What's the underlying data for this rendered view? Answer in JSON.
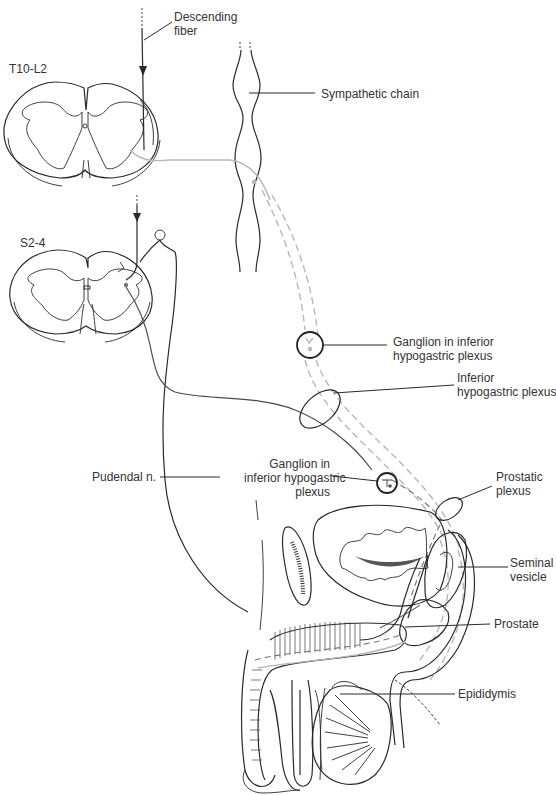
{
  "diagram": {
    "spinal_levels": [
      {
        "id": "thoracolumbar",
        "label": "T10-L2"
      },
      {
        "id": "sacral",
        "label": "S2-4"
      }
    ],
    "labels": {
      "descending_fiber": [
        "Descending",
        "fiber"
      ],
      "sympathetic_chain": "Sympathetic chain",
      "ganglion_upper": [
        "Ganglion in inferior",
        "hypogastric plexus"
      ],
      "inferior_hypogastric_plexus": [
        "Inferior",
        "hypogastric plexus"
      ],
      "pudendal_nerve": "Pudendal n.",
      "ganglion_lower": [
        "Ganglion in",
        "inferior hypogastric",
        "plexus"
      ],
      "prostatic_plexus": [
        "Prostatic",
        "plexus"
      ],
      "seminal_vesicle": [
        "Seminal",
        "vesicle"
      ],
      "prostate": "Prostate",
      "epididymis": "Epididymis"
    },
    "pathways": [
      {
        "name": "sympathetic",
        "style": "light gray solid/dashed",
        "color": "#b8b8b8"
      },
      {
        "name": "parasympathetic",
        "style": "dark solid/dashed",
        "color": "#4a4a4a"
      },
      {
        "name": "somatic (pudendal)",
        "style": "black solid",
        "color": "#2a2a2a"
      }
    ]
  }
}
